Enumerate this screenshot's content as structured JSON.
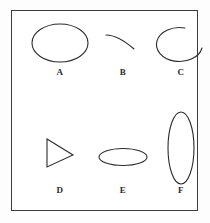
{
  "figure": {
    "background_color": "#ffffff",
    "frame_color": "#3c3c3c",
    "stroke_color": "#2b2b2b",
    "label_color": "#2a2a2a",
    "panels": [
      {
        "id": "a",
        "label": "A",
        "shape_name": "ellipse",
        "description": "closed horizontal ellipse",
        "width": 56,
        "height": 38
      },
      {
        "id": "b",
        "label": "B",
        "shape_name": "arc",
        "description": "short open arc descending left to right",
        "width": 34,
        "height": 16
      },
      {
        "id": "c",
        "label": "C",
        "shape_name": "open-ellipse",
        "description": "nearly closed ellipse with gap at upper right",
        "width": 46,
        "height": 34
      },
      {
        "id": "d",
        "label": "D",
        "shape_name": "triangle",
        "description": "right pointing triangle with vertical left edge",
        "width": 26,
        "height": 28
      },
      {
        "id": "e",
        "label": "E",
        "shape_name": "flat-ellipse",
        "description": "wide flattened ellipse",
        "width": 48,
        "height": 17
      },
      {
        "id": "f",
        "label": "F",
        "shape_name": "tall-ellipse",
        "description": "tall narrow vertical ellipse",
        "width": 26,
        "height": 72
      }
    ]
  }
}
